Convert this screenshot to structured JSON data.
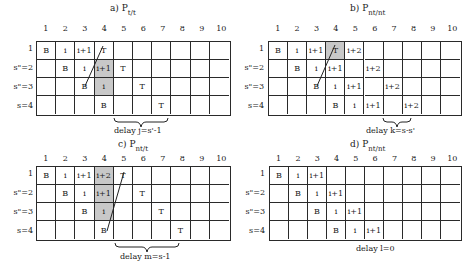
{
  "columns": [
    "1",
    "2",
    "3",
    "4",
    "5",
    "6",
    "7",
    "8",
    "9",
    "10"
  ],
  "rows": [
    "1",
    "s\"=2",
    "s\"=3",
    "s=4"
  ],
  "panels": [
    {
      "id": "a",
      "title_prefix": "a) P",
      "title_sub": "t/t",
      "cells": [
        [
          "B",
          "i",
          "i+1",
          "T",
          "",
          "",
          "",
          "",
          "",
          ""
        ],
        [
          "",
          "B",
          "i",
          "i+1",
          "T",
          "",
          "",
          "",
          "",
          ""
        ],
        [
          "",
          "",
          "B",
          "i",
          "",
          "T",
          "",
          "",
          "",
          ""
        ],
        [
          "",
          "",
          "",
          "B",
          "",
          "",
          "T",
          "",
          "",
          ""
        ]
      ],
      "shaded": [
        [
          1,
          3
        ],
        [
          2,
          3
        ]
      ],
      "delay_label": "delay j=s'-1"
    },
    {
      "id": "b",
      "title_prefix": "b) P",
      "title_sub": "nt/nt",
      "cells": [
        [
          "B",
          "i",
          "i+1",
          "T",
          "i+2",
          "",
          "",
          "",
          "",
          ""
        ],
        [
          "",
          "B",
          "i",
          "i+1",
          "",
          "i+2",
          "",
          "",
          "",
          ""
        ],
        [
          "",
          "",
          "B",
          "i",
          "i+1",
          "",
          "i+2",
          "",
          "",
          ""
        ],
        [
          "",
          "",
          "",
          "B",
          "i",
          "i+1",
          "",
          "i+2",
          "",
          ""
        ]
      ],
      "shaded": [
        [
          0,
          3
        ]
      ],
      "delay_label": "delay k=s-s'"
    },
    {
      "id": "c",
      "title_prefix": "c) P",
      "title_sub": "nt/t",
      "cells": [
        [
          "B",
          "i",
          "i+1",
          "i+2",
          "T",
          "",
          "",
          "",
          "",
          ""
        ],
        [
          "",
          "B",
          "i",
          "i+1",
          "",
          "T",
          "",
          "",
          "",
          ""
        ],
        [
          "",
          "",
          "B",
          "i",
          "",
          "",
          "T",
          "",
          "",
          ""
        ],
        [
          "",
          "",
          "",
          "B",
          "",
          "",
          "",
          "T",
          "",
          ""
        ]
      ],
      "shaded": [
        [
          0,
          3
        ],
        [
          1,
          3
        ],
        [
          2,
          3
        ]
      ],
      "delay_label": "delay m=s-1"
    },
    {
      "id": "d",
      "title_prefix": "d) P",
      "title_sub": "nt/nt",
      "cells": [
        [
          "B",
          "i",
          "i+1",
          "",
          "",
          "",
          "",
          "",
          "",
          ""
        ],
        [
          "",
          "B",
          "i",
          "i+1",
          "",
          "",
          "",
          "",
          "",
          ""
        ],
        [
          "",
          "",
          "B",
          "i",
          "i+1",
          "",
          "",
          "",
          "",
          ""
        ],
        [
          "",
          "",
          "",
          "B",
          "i",
          "i+1",
          "",
          "",
          "",
          ""
        ]
      ],
      "shaded": [],
      "delay_label": "delay l=0"
    }
  ],
  "colors": {
    "grid_line": "#2a2a2a",
    "shade": "#c8c8c8",
    "background": "#ffffff"
  }
}
